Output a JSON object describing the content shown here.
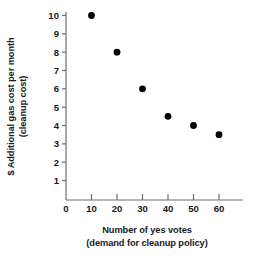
{
  "chart_data": {
    "type": "scatter",
    "title": "",
    "subtitle": "",
    "xlabel": "Number of yes votes",
    "xlabel_line2": "(demand for cleanup policy)",
    "ylabel": "$ Additional gas cost per month",
    "ylabel_line2": "(cleanup cost)",
    "x": [
      10,
      20,
      30,
      40,
      50,
      60
    ],
    "values": [
      10,
      8,
      6,
      4.5,
      4,
      3.5
    ],
    "points": [
      {
        "x": 10,
        "y": 10
      },
      {
        "x": 20,
        "y": 8
      },
      {
        "x": 30,
        "y": 6
      },
      {
        "x": 40,
        "y": 4.5
      },
      {
        "x": 50,
        "y": 4
      },
      {
        "x": 60,
        "y": 3.5
      }
    ],
    "xlim": [
      0,
      66
    ],
    "ylim": [
      0,
      10.4
    ],
    "xticks": [
      0,
      10,
      20,
      30,
      40,
      50,
      60
    ],
    "xtick_labels": [
      "0",
      "10",
      "20",
      "30",
      "40",
      "50",
      "60"
    ],
    "yticks": [
      1,
      2,
      3,
      4,
      5,
      6,
      7,
      8,
      9,
      10
    ],
    "ytick_labels": [
      "1",
      "2",
      "3",
      "4",
      "5",
      "6",
      "7",
      "8",
      "9",
      "10"
    ],
    "grid": false,
    "legend": false,
    "marker": "filled-circle",
    "marker_color": "#000000",
    "axis_color": "#6e6e6e",
    "background": "#ffffff"
  },
  "axes": {
    "y_title_line1": "$ Additional gas cost per month",
    "y_title_line2": "(cleanup cost)",
    "x_title_line1": "Number of yes votes",
    "x_title_line2": "(demand for cleanup policy)"
  }
}
